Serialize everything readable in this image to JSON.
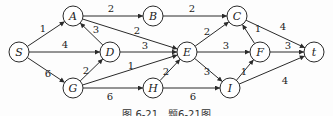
{
  "diagram": {
    "type": "directed-weighted-graph",
    "nodes": [
      {
        "id": "S",
        "label": "S",
        "x": 19,
        "y": 52
      },
      {
        "id": "A",
        "label": "A",
        "x": 73,
        "y": 16
      },
      {
        "id": "B",
        "label": "B",
        "x": 153,
        "y": 16
      },
      {
        "id": "C",
        "label": "C",
        "x": 237,
        "y": 16
      },
      {
        "id": "D",
        "label": "D",
        "x": 110,
        "y": 52
      },
      {
        "id": "E",
        "label": "E",
        "x": 187,
        "y": 52
      },
      {
        "id": "F",
        "label": "F",
        "x": 260,
        "y": 52
      },
      {
        "id": "t",
        "label": "t",
        "x": 314,
        "y": 52
      },
      {
        "id": "G",
        "label": "G",
        "x": 73,
        "y": 88
      },
      {
        "id": "H",
        "label": "H",
        "x": 153,
        "y": 88
      },
      {
        "id": "I",
        "label": "I",
        "x": 230,
        "y": 88
      }
    ],
    "edges": [
      {
        "from": "S",
        "to": "A",
        "weight": "1",
        "lx": 43,
        "ly": 32
      },
      {
        "from": "S",
        "to": "D",
        "weight": "4",
        "lx": 65,
        "ly": 48
      },
      {
        "from": "S",
        "to": "G",
        "weight": "6",
        "lx": 48,
        "ly": 77
      },
      {
        "from": "A",
        "to": "B",
        "weight": "2",
        "lx": 111,
        "ly": 12
      },
      {
        "from": "A",
        "to": "E",
        "weight": "2",
        "lx": 137,
        "ly": 34
      },
      {
        "from": "D",
        "to": "A",
        "weight": "3",
        "lx": 96,
        "ly": 33
      },
      {
        "from": "D",
        "to": "E",
        "weight": "3",
        "lx": 145,
        "ly": 49
      },
      {
        "from": "G",
        "to": "D",
        "weight": "2",
        "lx": 86,
        "ly": 74
      },
      {
        "from": "G",
        "to": "E",
        "weight": "1",
        "lx": 131,
        "ly": 69
      },
      {
        "from": "G",
        "to": "H",
        "weight": "6",
        "lx": 110,
        "ly": 100
      },
      {
        "from": "H",
        "to": "E",
        "weight": "2",
        "lx": 166,
        "ly": 75
      },
      {
        "from": "H",
        "to": "I",
        "weight": "6",
        "lx": 193,
        "ly": 100
      },
      {
        "from": "B",
        "to": "C",
        "weight": "2",
        "lx": 192,
        "ly": 12
      },
      {
        "from": "E",
        "to": "C",
        "weight": "2",
        "lx": 207,
        "ly": 35
      },
      {
        "from": "E",
        "to": "F",
        "weight": "3",
        "lx": 226,
        "ly": 49
      },
      {
        "from": "E",
        "to": "I",
        "weight": "3",
        "lx": 207,
        "ly": 75
      },
      {
        "from": "F",
        "to": "C",
        "weight": "1",
        "lx": 258,
        "ly": 32
      },
      {
        "from": "I",
        "to": "F",
        "weight": "1",
        "lx": 244,
        "ly": 75
      },
      {
        "from": "C",
        "to": "t",
        "weight": "4",
        "lx": 283,
        "ly": 30
      },
      {
        "from": "F",
        "to": "t",
        "weight": "3",
        "lx": 288,
        "ly": 49
      },
      {
        "from": "I",
        "to": "t",
        "weight": "4",
        "lx": 285,
        "ly": 84
      }
    ]
  },
  "caption": "图 6-21　题6-21图"
}
